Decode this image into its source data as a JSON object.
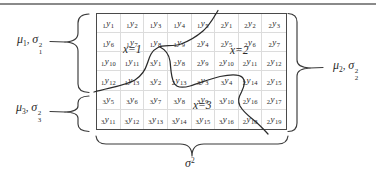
{
  "grid": {
    "var_letter": "y",
    "rows": [
      [
        [
          "1",
          "1"
        ],
        [
          "1",
          "2"
        ],
        [
          "1",
          "3"
        ],
        [
          "1",
          "4"
        ],
        [
          "1",
          "5"
        ],
        [
          "2",
          "1"
        ],
        [
          "2",
          "2"
        ],
        [
          "2",
          "3"
        ]
      ],
      [
        [
          "1",
          "6"
        ],
        [
          "1",
          "7"
        ],
        [
          "1",
          "8"
        ],
        [
          "1",
          "9"
        ],
        [
          "2",
          "4"
        ],
        [
          "2",
          "5"
        ],
        [
          "2",
          "6"
        ],
        [
          "2",
          "7"
        ]
      ],
      [
        [
          "1",
          "10"
        ],
        [
          "1",
          "11"
        ],
        [
          "3",
          "1"
        ],
        [
          "2",
          "8"
        ],
        [
          "2",
          "9"
        ],
        [
          "2",
          "10"
        ],
        [
          "2",
          "11"
        ],
        [
          "2",
          "12"
        ]
      ],
      [
        [
          "1",
          "12"
        ],
        [
          "1",
          "13"
        ],
        [
          "3",
          "2"
        ],
        [
          "2",
          "13"
        ],
        [
          "3",
          "3"
        ],
        [
          "3",
          "4"
        ],
        [
          "2",
          "14"
        ],
        [
          "2",
          "15"
        ]
      ],
      [
        [
          "3",
          "5"
        ],
        [
          "3",
          "6"
        ],
        [
          "3",
          "7"
        ],
        [
          "3",
          "8"
        ],
        [
          "3",
          "9"
        ],
        [
          "3",
          "10"
        ],
        [
          "2",
          "16"
        ],
        [
          "2",
          "17"
        ]
      ],
      [
        [
          "3",
          "11"
        ],
        [
          "3",
          "12"
        ],
        [
          "3",
          "13"
        ],
        [
          "3",
          "14"
        ],
        [
          "3",
          "15"
        ],
        [
          "3",
          "16"
        ],
        [
          "2",
          "18"
        ],
        [
          "2",
          "19"
        ]
      ]
    ]
  },
  "region_labels": {
    "x1": "x=1",
    "x2": "x=2",
    "x3": "x=3"
  },
  "stat_labels": {
    "group1": {
      "mu": "μ",
      "mu_sub": "1",
      "comma": ", ",
      "sigma": "σ",
      "sigma_sub": "1",
      "sigma_sup": "2"
    },
    "group2": {
      "mu": "μ",
      "mu_sub": "2",
      "comma": ", ",
      "sigma": "σ",
      "sigma_sub": "2",
      "sigma_sup": "2"
    },
    "group3": {
      "mu": "μ",
      "mu_sub": "3",
      "comma": ", ",
      "sigma": "σ",
      "sigma_sub": "3",
      "sigma_sup": "2"
    },
    "overall": {
      "sigma": "σ",
      "sigma_sup": "2"
    }
  },
  "colors": {
    "ink": "#2b2b2b",
    "brace": "#3a3a3a",
    "border": "#4a4a4a",
    "grid_line": "#dcdcdc",
    "page_rule": "#8a8a8a"
  }
}
